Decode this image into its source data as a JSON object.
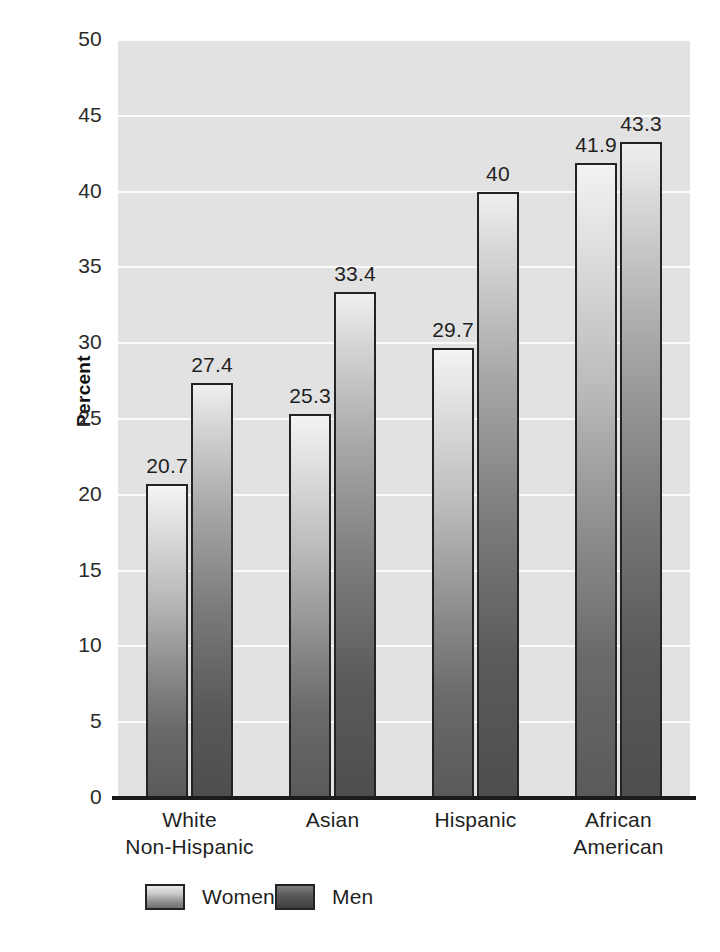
{
  "chart_data": {
    "type": "bar",
    "title": "",
    "subtitle": "",
    "xlabel": "",
    "ylabel": "Percent",
    "ylim": [
      0,
      50
    ],
    "ytick_values": [
      0,
      5,
      10,
      15,
      20,
      25,
      30,
      35,
      40,
      45,
      50
    ],
    "ytick_labels": [
      "0",
      "5",
      "10",
      "15",
      "20",
      "25",
      "30",
      "35",
      "40",
      "45",
      "50"
    ],
    "grid": "horizontal",
    "legend_position": "bottom",
    "categories": [
      "White\nNon-Hispanic",
      "Asian",
      "Hispanic",
      "African\nAmerican"
    ],
    "category_lines": [
      [
        "White",
        "Non-Hispanic"
      ],
      [
        "Asian",
        ""
      ],
      [
        "Hispanic",
        ""
      ],
      [
        "African",
        "American"
      ]
    ],
    "series": [
      {
        "name": "Women",
        "values": [
          20.7,
          25.3,
          29.7,
          41.9
        ],
        "labels": [
          "20.7",
          "25.3",
          "29.7",
          "41.9"
        ]
      },
      {
        "name": "Men",
        "values": [
          27.4,
          33.4,
          40.0,
          43.3
        ],
        "labels": [
          "27.4",
          "33.4",
          "40",
          "43.3"
        ]
      }
    ],
    "colors": {
      "plot_background": "#e2e2e2",
      "gridline": "#fbfbfb",
      "axis": "#1b1b1b",
      "bar_outline": "#232323",
      "text": "#1f1f1f",
      "page_background": "#ffffff"
    }
  },
  "legend": {
    "items": [
      {
        "label": "Women",
        "swatch": "women-swatch"
      },
      {
        "label": "Men",
        "swatch": "men-swatch"
      }
    ]
  },
  "axis": {
    "y_title": "Percent",
    "ticks": [
      "50",
      "45",
      "40",
      "35",
      "30",
      "25",
      "20",
      "15",
      "10",
      "5",
      "0"
    ]
  },
  "bleed_through": {
    "lines": [
      "of the following are reported",
      "be because of how they showed bringing or time",
      "and modification; healthy partner relationships are",
      "and ones it reason that that the always the same",
      "they have a rate of it; and can it can see here",
      "he is not such to show this kind of the",
      "any sentence is a manner of the little",
      "a considerate number of the trend",
      "to the same that the kind to have used"
    ]
  }
}
